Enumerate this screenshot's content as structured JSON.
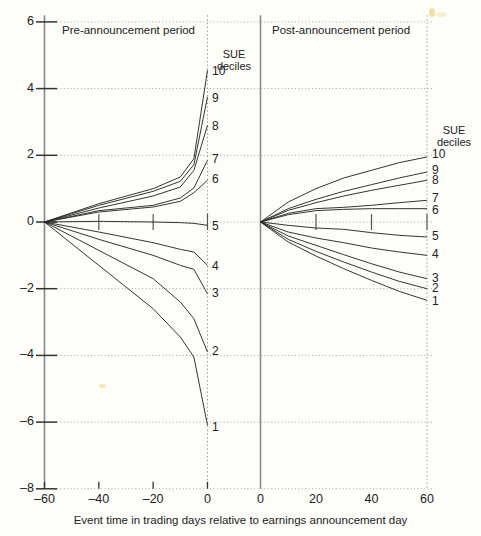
{
  "chart_data": {
    "type": "line",
    "title": "",
    "xlabel": "Event time in trading days relative to earnings announcement day",
    "ylabel": "",
    "ylim": [
      -8,
      6
    ],
    "yticks": [
      6,
      4,
      2,
      0,
      -2,
      -4,
      -6,
      -8
    ],
    "ytick_labels": [
      "6",
      "4",
      "2",
      "0",
      "-2",
      "-4",
      "-6",
      "-8"
    ],
    "grid": "horizontal dotted gridlines at every y tick; dotted vertical boundary lines at day 0 of each panel",
    "legend_position": "inline at right edge of each panel (SUE decile numbers)",
    "panels": [
      {
        "name": "pre-announcement",
        "label": "Pre-announcement period",
        "xlim": [
          -60,
          0
        ],
        "xticks": [
          -60,
          -40,
          -20,
          0
        ],
        "xtick_labels": [
          "-60",
          "-40",
          "-20",
          "0"
        ],
        "legend_title": "SUE\ndeciles",
        "series": [
          {
            "name": "10",
            "x": [
              -60,
              -40,
              -20,
              -10,
              -5,
              0
            ],
            "y": [
              0.0,
              0.55,
              1.0,
              1.35,
              1.9,
              4.55
            ]
          },
          {
            "name": "9",
            "x": [
              -60,
              -40,
              -20,
              -10,
              -5,
              0
            ],
            "y": [
              0.0,
              0.5,
              0.92,
              1.22,
              1.72,
              3.75
            ]
          },
          {
            "name": "8",
            "x": [
              -60,
              -40,
              -20,
              -10,
              -5,
              0
            ],
            "y": [
              0.0,
              0.42,
              0.78,
              1.05,
              1.55,
              2.9
            ]
          },
          {
            "name": "7",
            "x": [
              -60,
              -40,
              -20,
              -10,
              -5,
              0
            ],
            "y": [
              0.0,
              0.34,
              0.5,
              0.72,
              1.02,
              1.85
            ]
          },
          {
            "name": "6",
            "x": [
              -60,
              -40,
              -20,
              -10,
              -5,
              0
            ],
            "y": [
              0.0,
              0.3,
              0.45,
              0.62,
              0.88,
              1.25
            ]
          },
          {
            "name": "5",
            "x": [
              -60,
              -40,
              -20,
              -10,
              -5,
              0
            ],
            "y": [
              0.0,
              0.02,
              0.0,
              -0.02,
              -0.04,
              -0.1
            ]
          },
          {
            "name": "4",
            "x": [
              -60,
              -40,
              -20,
              -10,
              -5,
              0
            ],
            "y": [
              0.0,
              -0.3,
              -0.62,
              -0.82,
              -0.9,
              -1.3
            ]
          },
          {
            "name": "3",
            "x": [
              -60,
              -40,
              -20,
              -10,
              -5,
              0
            ],
            "y": [
              0.0,
              -0.52,
              -1.0,
              -1.3,
              -1.42,
              -2.15
            ]
          },
          {
            "name": "2",
            "x": [
              -60,
              -40,
              -20,
              -10,
              -5,
              0
            ],
            "y": [
              0.0,
              -0.85,
              -1.7,
              -2.4,
              -2.9,
              -3.9
            ]
          },
          {
            "name": "1",
            "x": [
              -60,
              -40,
              -20,
              -10,
              -5,
              0
            ],
            "y": [
              0.0,
              -1.3,
              -2.6,
              -3.45,
              -4.05,
              -6.1
            ]
          }
        ]
      },
      {
        "name": "post-announcement",
        "label": "Post-announcement period",
        "xlim": [
          0,
          60
        ],
        "xticks": [
          0,
          20,
          40,
          60
        ],
        "xtick_labels": [
          "0",
          "20",
          "40",
          "60"
        ],
        "legend_title": "SUE\ndeciles",
        "series": [
          {
            "name": "10",
            "x": [
              0,
              10,
              20,
              30,
              40,
              50,
              60
            ],
            "y": [
              0.0,
              0.6,
              1.0,
              1.32,
              1.55,
              1.78,
              1.95
            ]
          },
          {
            "name": "9",
            "x": [
              0,
              10,
              20,
              30,
              40,
              50,
              60
            ],
            "y": [
              0.0,
              0.4,
              0.68,
              0.92,
              1.12,
              1.32,
              1.5
            ]
          },
          {
            "name": "8",
            "x": [
              0,
              10,
              20,
              30,
              40,
              50,
              60
            ],
            "y": [
              0.0,
              0.35,
              0.58,
              0.78,
              0.95,
              1.1,
              1.25
            ]
          },
          {
            "name": "7",
            "x": [
              0,
              10,
              20,
              30,
              40,
              50,
              60
            ],
            "y": [
              0.0,
              0.26,
              0.4,
              0.44,
              0.5,
              0.58,
              0.65
            ]
          },
          {
            "name": "6",
            "x": [
              0,
              10,
              20,
              30,
              40,
              50,
              60
            ],
            "y": [
              0.0,
              0.22,
              0.34,
              0.38,
              0.4,
              0.4,
              0.4
            ]
          },
          {
            "name": "5",
            "x": [
              0,
              10,
              20,
              30,
              40,
              50,
              60
            ],
            "y": [
              0.0,
              -0.1,
              -0.18,
              -0.22,
              -0.32,
              -0.4,
              -0.45
            ]
          },
          {
            "name": "4",
            "x": [
              0,
              10,
              20,
              30,
              40,
              50,
              60
            ],
            "y": [
              0.0,
              -0.3,
              -0.48,
              -0.62,
              -0.78,
              -0.9,
              -1.0
            ]
          },
          {
            "name": "3",
            "x": [
              0,
              10,
              20,
              30,
              40,
              50,
              60
            ],
            "y": [
              0.0,
              -0.42,
              -0.7,
              -0.98,
              -1.25,
              -1.5,
              -1.7
            ]
          },
          {
            "name": "2",
            "x": [
              0,
              10,
              20,
              30,
              40,
              50,
              60
            ],
            "y": [
              0.0,
              -0.52,
              -0.88,
              -1.2,
              -1.5,
              -1.78,
              -2.0
            ]
          },
          {
            "name": "1",
            "x": [
              0,
              10,
              20,
              30,
              40,
              50,
              60
            ],
            "y": [
              0.0,
              -0.6,
              -1.02,
              -1.4,
              -1.75,
              -2.08,
              -2.35
            ]
          }
        ]
      }
    ]
  },
  "yaxis": {
    "ticks": [
      {
        "label": "6",
        "value": 6
      },
      {
        "label": "4",
        "value": 4
      },
      {
        "label": "2",
        "value": 2
      },
      {
        "label": "0",
        "value": 0
      },
      {
        "label": "–2",
        "value": -2
      },
      {
        "label": "–4",
        "value": -4
      },
      {
        "label": "–6",
        "value": -6
      },
      {
        "label": "–8",
        "value": -8
      }
    ]
  },
  "xaxis": {
    "caption": "Event time in trading days relative to earnings announcement day",
    "ticks_pre": [
      {
        "label": "–60",
        "value": -60
      },
      {
        "label": "–40",
        "value": -40
      },
      {
        "label": "–20",
        "value": -20
      },
      {
        "label": "0",
        "value": 0
      }
    ],
    "ticks_post": [
      {
        "label": "0",
        "value": 0
      },
      {
        "label": "20",
        "value": 20
      },
      {
        "label": "40",
        "value": 40
      },
      {
        "label": "60",
        "value": 60
      }
    ]
  },
  "panel_labels": {
    "pre": "Pre-announcement period",
    "post": "Post-announcement period"
  },
  "legend": {
    "title_line1": "SUE",
    "title_line2": "deciles",
    "deciles_pre": [
      "10",
      "9",
      "8",
      "7",
      "6",
      "5",
      "4",
      "3",
      "2",
      "1"
    ],
    "deciles_post": [
      "10",
      "9",
      "8",
      "7",
      "6",
      "5",
      "4",
      "3",
      "2",
      "1"
    ]
  },
  "style": {
    "line_color": "#2a2a2a",
    "grid_color": "#9a9a9a",
    "axis_color": "#888888",
    "background": "#fdfdfa"
  }
}
